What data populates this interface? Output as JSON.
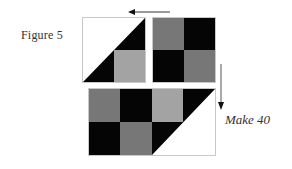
{
  "figure": {
    "label": "Figure 5",
    "instruction": "Make 40"
  },
  "colors": {
    "dark": "#050505",
    "medium": "#777777",
    "light": "#a3a3a3",
    "background": "#ffffff",
    "border": "#c8c8c8",
    "arrow": "#333333"
  },
  "units": {
    "half_square_triangle_unit": {
      "triangle_color": "dark",
      "square_color": "light",
      "background": "white"
    },
    "four_patch": {
      "cells": [
        "medium",
        "dark",
        "dark",
        "medium"
      ]
    },
    "combined_row": {
      "cells_top": [
        "medium",
        "dark",
        "light"
      ],
      "cells_bottom": [
        "dark",
        "medium"
      ],
      "triangle_color": "dark"
    }
  },
  "arrows": [
    {
      "direction": "left",
      "position": "above top units"
    },
    {
      "direction": "down",
      "position": "right of units"
    }
  ]
}
